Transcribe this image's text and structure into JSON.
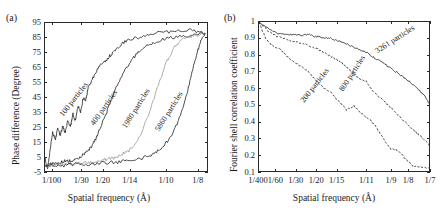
{
  "figure": {
    "panel_a_tag": "(a)",
    "panel_b_tag": "(b)"
  },
  "chart_data": [
    {
      "type": "line",
      "panel": "(a)",
      "title": "",
      "xlabel": "Spatial frequency (Å)",
      "ylabel": "Phase difference (Degree)",
      "grid": false,
      "legend_position": "inline-curve-labels",
      "xticks": [
        "1/100",
        "1/30",
        "1/20",
        "1/14",
        "1/10",
        "1/8"
      ],
      "xtick_positions": [
        0.01,
        0.0333,
        0.05,
        0.0714,
        0.1,
        0.125
      ],
      "xlim": [
        0.004,
        0.133
      ],
      "yticks": [
        -5,
        5,
        15,
        25,
        35,
        45,
        55,
        65,
        75,
        85,
        95
      ],
      "ylim": [
        -5,
        95
      ],
      "series": [
        {
          "name": "100 particles",
          "style": "solid",
          "x": [
            0.004,
            0.006,
            0.008,
            0.01,
            0.012,
            0.014,
            0.016,
            0.018,
            0.02,
            0.022,
            0.024,
            0.026,
            0.028,
            0.03,
            0.032,
            0.034,
            0.036,
            0.038,
            0.04,
            0.044,
            0.048,
            0.052,
            0.056,
            0.06,
            0.066,
            0.072,
            0.08,
            0.09,
            0.1,
            0.11,
            0.12,
            0.13
          ],
          "y": [
            5,
            -2,
            10,
            22,
            17,
            25,
            20,
            26,
            22,
            30,
            26,
            34,
            30,
            40,
            35,
            45,
            43,
            52,
            55,
            62,
            68,
            70,
            74,
            78,
            82,
            84,
            86,
            88,
            89,
            90,
            90,
            88
          ]
        },
        {
          "name": "400 particles",
          "style": "solid",
          "x": [
            0.004,
            0.008,
            0.012,
            0.016,
            0.02,
            0.024,
            0.028,
            0.032,
            0.036,
            0.04,
            0.044,
            0.048,
            0.052,
            0.056,
            0.06,
            0.066,
            0.072,
            0.078,
            0.085,
            0.092,
            0.1,
            0.11,
            0.12,
            0.13
          ],
          "y": [
            0,
            1,
            1,
            2,
            3,
            3,
            4,
            6,
            8,
            12,
            18,
            26,
            34,
            44,
            52,
            62,
            70,
            76,
            80,
            83,
            85,
            86,
            87,
            88
          ]
        },
        {
          "name": "1980 particles",
          "style": "solid-light",
          "x": [
            0.004,
            0.01,
            0.016,
            0.022,
            0.028,
            0.034,
            0.04,
            0.046,
            0.052,
            0.058,
            0.064,
            0.07,
            0.076,
            0.082,
            0.088,
            0.094,
            0.1,
            0.106,
            0.112,
            0.118,
            0.124,
            0.13
          ],
          "y": [
            0,
            0,
            1,
            1,
            1,
            2,
            2,
            3,
            4,
            5,
            7,
            10,
            16,
            26,
            40,
            56,
            70,
            79,
            84,
            86,
            87,
            88
          ]
        },
        {
          "name": "5860 particles",
          "style": "solid",
          "x": [
            0.004,
            0.012,
            0.02,
            0.028,
            0.036,
            0.044,
            0.052,
            0.06,
            0.068,
            0.076,
            0.084,
            0.09,
            0.096,
            0.102,
            0.108,
            0.114,
            0.118,
            0.122,
            0.126,
            0.13
          ],
          "y": [
            0,
            0,
            0,
            1,
            1,
            1,
            2,
            2,
            3,
            4,
            6,
            8,
            12,
            18,
            28,
            42,
            56,
            70,
            82,
            88
          ]
        }
      ],
      "curve_labels": [
        {
          "text": "100 particles",
          "x": 0.0175,
          "y": 36,
          "angle": -52
        },
        {
          "text": "400 particles",
          "x": 0.0415,
          "y": 30,
          "angle": -55
        },
        {
          "text": "1980 particles",
          "x": 0.0665,
          "y": 28,
          "angle": -58
        },
        {
          "text": "5860 particles",
          "x": 0.0925,
          "y": 26,
          "angle": -58
        }
      ]
    },
    {
      "type": "line",
      "panel": "(b)",
      "title": "",
      "xlabel": "Spatial frequency (Å)",
      "ylabel": "Fourier shell correlation coefficient",
      "grid": false,
      "legend_position": "inline-curve-labels",
      "xticks": [
        "1/400",
        "1/60",
        "1/30",
        "1/20",
        "1/15",
        "1/11",
        "1/9",
        "1/8",
        "1/7"
      ],
      "xtick_positions": [
        0.0025,
        0.01667,
        0.0333,
        0.05,
        0.0667,
        0.0909,
        0.1111,
        0.125,
        0.1429
      ],
      "xlim": [
        0.0025,
        0.1429
      ],
      "yticks": [
        0.1,
        0.2,
        0.3,
        0.4,
        0.5,
        0.6,
        0.7,
        0.8,
        0.9,
        1
      ],
      "ylim": [
        0.1,
        1.0
      ],
      "series": [
        {
          "name": "3261 particles",
          "style": "solid",
          "x": [
            0.0025,
            0.01,
            0.017,
            0.024,
            0.03,
            0.036,
            0.042,
            0.048,
            0.054,
            0.06,
            0.066,
            0.072,
            0.078,
            0.084,
            0.09,
            0.096,
            0.102,
            0.108,
            0.114,
            0.12,
            0.126,
            0.132,
            0.138,
            0.1429
          ],
          "y": [
            1.0,
            0.96,
            0.935,
            0.925,
            0.925,
            0.92,
            0.925,
            0.915,
            0.91,
            0.905,
            0.89,
            0.875,
            0.855,
            0.84,
            0.82,
            0.79,
            0.765,
            0.735,
            0.705,
            0.675,
            0.64,
            0.6,
            0.555,
            0.5
          ]
        },
        {
          "name": "800 particles",
          "style": "dashed",
          "x": [
            0.0025,
            0.01,
            0.017,
            0.024,
            0.03,
            0.036,
            0.042,
            0.048,
            0.054,
            0.06,
            0.066,
            0.072,
            0.078,
            0.084,
            0.09,
            0.096,
            0.102,
            0.108,
            0.114,
            0.12,
            0.126,
            0.132,
            0.138,
            0.1429
          ],
          "y": [
            1.0,
            0.945,
            0.915,
            0.9,
            0.885,
            0.875,
            0.865,
            0.845,
            0.825,
            0.8,
            0.775,
            0.745,
            0.705,
            0.665,
            0.645,
            0.585,
            0.545,
            0.505,
            0.46,
            0.415,
            0.375,
            0.335,
            0.295,
            0.255
          ]
        },
        {
          "name": "200 particles",
          "style": "dashed",
          "x": [
            0.0025,
            0.008,
            0.014,
            0.02,
            0.026,
            0.032,
            0.038,
            0.044,
            0.05,
            0.056,
            0.062,
            0.068,
            0.074,
            0.08,
            0.086,
            0.092,
            0.098,
            0.104,
            0.11,
            0.116,
            0.122,
            0.128,
            0.134,
            0.1429
          ],
          "y": [
            1.0,
            0.9,
            0.855,
            0.835,
            0.79,
            0.755,
            0.735,
            0.695,
            0.645,
            0.6,
            0.575,
            0.525,
            0.475,
            0.5,
            0.455,
            0.425,
            0.375,
            0.305,
            0.245,
            0.235,
            0.185,
            0.145,
            0.135,
            0.125
          ]
        }
      ],
      "curve_labels": [
        {
          "text": "3261 particles",
          "x": 0.0985,
          "y": 0.845,
          "angle": -33
        },
        {
          "text": "800 particles",
          "x": 0.0705,
          "y": 0.615,
          "angle": -57
        },
        {
          "text": "200 particles",
          "x": 0.0385,
          "y": 0.545,
          "angle": -52
        }
      ]
    }
  ]
}
